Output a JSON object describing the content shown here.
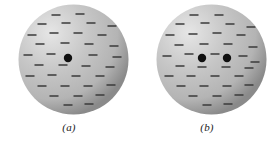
{
  "figure": {
    "type": "physics-diagram",
    "background_color": "#ffffff",
    "panels": [
      {
        "id": "a",
        "caption": "(a)",
        "sphere": {
          "center_x": 55.5,
          "center_y": 55.5,
          "radius": 55,
          "highlight_color": "#e6e6e6",
          "midtone_color": "#b4b4b4",
          "edge_color": "#8a8a8a",
          "highlight_offset_x": 32,
          "highlight_offset_y": 28
        },
        "point_charges": [
          {
            "cx": 50,
            "cy": 54,
            "r": 4.2,
            "color": "#101010"
          }
        ],
        "dash_color": "#3a3a3a",
        "dash_length": 9,
        "dash_thickness": 1.6,
        "dashes": [
          {
            "cx": 38,
            "cy": 11
          },
          {
            "cx": 62,
            "cy": 10
          },
          {
            "cx": 24,
            "cy": 20
          },
          {
            "cx": 48,
            "cy": 19
          },
          {
            "cx": 73,
            "cy": 19
          },
          {
            "cx": 94,
            "cy": 22
          },
          {
            "cx": 14,
            "cy": 31
          },
          {
            "cx": 36,
            "cy": 29
          },
          {
            "cx": 60,
            "cy": 29
          },
          {
            "cx": 84,
            "cy": 31
          },
          {
            "cx": 22,
            "cy": 40
          },
          {
            "cx": 47,
            "cy": 39
          },
          {
            "cx": 71,
            "cy": 40
          },
          {
            "cx": 96,
            "cy": 42
          },
          {
            "cx": 10,
            "cy": 51
          },
          {
            "cx": 33,
            "cy": 50
          },
          {
            "cx": 75,
            "cy": 51
          },
          {
            "cx": 99,
            "cy": 53
          },
          {
            "cx": 21,
            "cy": 61
          },
          {
            "cx": 45,
            "cy": 61
          },
          {
            "cx": 68,
            "cy": 62
          },
          {
            "cx": 92,
            "cy": 63
          },
          {
            "cx": 12,
            "cy": 72
          },
          {
            "cx": 34,
            "cy": 71
          },
          {
            "cx": 58,
            "cy": 72
          },
          {
            "cx": 82,
            "cy": 72
          },
          {
            "cx": 24,
            "cy": 82
          },
          {
            "cx": 47,
            "cy": 82
          },
          {
            "cx": 70,
            "cy": 82
          },
          {
            "cx": 93,
            "cy": 81
          },
          {
            "cx": 36,
            "cy": 92
          },
          {
            "cx": 60,
            "cy": 92
          },
          {
            "cx": 82,
            "cy": 91
          },
          {
            "cx": 50,
            "cy": 101
          },
          {
            "cx": 71,
            "cy": 100
          }
        ]
      },
      {
        "id": "b",
        "caption": "(b)",
        "sphere": {
          "center_x": 55.5,
          "center_y": 55.5,
          "radius": 55,
          "highlight_color": "#e6e6e6",
          "midtone_color": "#b4b4b4",
          "edge_color": "#8a8a8a",
          "highlight_offset_x": 32,
          "highlight_offset_y": 28
        },
        "point_charges": [
          {
            "cx": 46,
            "cy": 54,
            "r": 4.2,
            "color": "#101010"
          },
          {
            "cx": 71,
            "cy": 54,
            "r": 4.2,
            "color": "#101010"
          }
        ],
        "dash_color": "#3a3a3a",
        "dash_length": 9,
        "dash_thickness": 1.6,
        "dashes": [
          {
            "cx": 38,
            "cy": 11
          },
          {
            "cx": 63,
            "cy": 11
          },
          {
            "cx": 24,
            "cy": 20
          },
          {
            "cx": 49,
            "cy": 19
          },
          {
            "cx": 74,
            "cy": 20
          },
          {
            "cx": 95,
            "cy": 23
          },
          {
            "cx": 14,
            "cy": 31
          },
          {
            "cx": 37,
            "cy": 30
          },
          {
            "cx": 61,
            "cy": 29
          },
          {
            "cx": 85,
            "cy": 31
          },
          {
            "cx": 23,
            "cy": 41
          },
          {
            "cx": 48,
            "cy": 40
          },
          {
            "cx": 72,
            "cy": 40
          },
          {
            "cx": 97,
            "cy": 43
          },
          {
            "cx": 11,
            "cy": 52
          },
          {
            "cx": 33,
            "cy": 50
          },
          {
            "cx": 59,
            "cy": 50
          },
          {
            "cx": 87,
            "cy": 52
          },
          {
            "cx": 99,
            "cy": 58
          },
          {
            "cx": 24,
            "cy": 62
          },
          {
            "cx": 46,
            "cy": 63
          },
          {
            "cx": 70,
            "cy": 63
          },
          {
            "cx": 93,
            "cy": 64
          },
          {
            "cx": 13,
            "cy": 72
          },
          {
            "cx": 35,
            "cy": 72
          },
          {
            "cx": 59,
            "cy": 72
          },
          {
            "cx": 83,
            "cy": 72
          },
          {
            "cx": 25,
            "cy": 82
          },
          {
            "cx": 48,
            "cy": 82
          },
          {
            "cx": 71,
            "cy": 82
          },
          {
            "cx": 93,
            "cy": 81
          },
          {
            "cx": 37,
            "cy": 92
          },
          {
            "cx": 61,
            "cy": 92
          },
          {
            "cx": 83,
            "cy": 91
          },
          {
            "cx": 51,
            "cy": 101
          },
          {
            "cx": 72,
            "cy": 100
          }
        ]
      }
    ]
  }
}
